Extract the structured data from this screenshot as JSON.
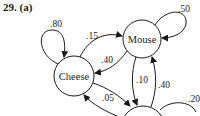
{
  "problem": {
    "number": "29.",
    "part": "(a)"
  },
  "diagram": {
    "type": "markov-transition-diagram",
    "nodes": [
      {
        "id": "mouse",
        "label": "Mouse"
      },
      {
        "id": "cheese",
        "label": "Cheese"
      },
      {
        "id": "third",
        "label": ""
      }
    ],
    "edges": [
      {
        "from": "cheese",
        "to": "cheese",
        "label": ".80"
      },
      {
        "from": "cheese",
        "to": "mouse",
        "label": ".15"
      },
      {
        "from": "mouse",
        "to": "mouse",
        "label": ".50"
      },
      {
        "from": "mouse",
        "to": "cheese",
        "label": ".40"
      },
      {
        "from": "mouse",
        "to": "third",
        "label": ".10"
      },
      {
        "from": "third",
        "to": "mouse",
        "label": ".40"
      },
      {
        "from": "cheese",
        "to": "third",
        "label": ".05"
      },
      {
        "from": "third",
        "to": "cheese",
        "label": ""
      },
      {
        "from": "third",
        "to": "third",
        "label": ".20"
      }
    ]
  }
}
